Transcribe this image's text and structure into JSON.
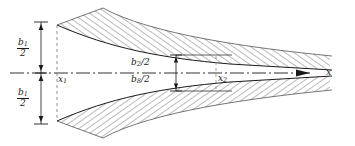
{
  "figure": {
    "background_color": "#ffffff",
    "line_color": "#1a1a1a",
    "hatch_color": "#555555",
    "width": 355,
    "height": 146
  },
  "labels": {
    "half_width_top": {
      "numerator": "b",
      "numerator_sub": "1",
      "denominator": "2",
      "text": "b1/2"
    },
    "half_width_bottom": {
      "numerator": "b",
      "numerator_sub": "1",
      "denominator": "2",
      "text": "b1/2"
    },
    "throat_top": {
      "base": "b",
      "sub": "2",
      "slash_den": "/2",
      "text": "b2/2"
    },
    "throat_bottom": {
      "base": "b",
      "sub": "8",
      "slash_den": "/2",
      "text": "b8/2"
    },
    "station_1": {
      "base": "x",
      "sub": "1",
      "text": "x1"
    },
    "station_2": {
      "base": "x",
      "sub": "2",
      "text": "x2"
    },
    "axis": {
      "base": "x",
      "text": "x"
    }
  },
  "elements": {
    "axis_name": "centerline-axis",
    "arrow_name": "x-axis-arrow",
    "upper_wall_name": "upper-wall-hatched",
    "lower_wall_name": "lower-wall-hatched",
    "left_dimension_name": "left-half-width-dimension",
    "throat_dimension_name": "throat-half-width-dimension",
    "station1_line_name": "station-1-dashed-line",
    "station2_line_name": "station-2-dashed-line"
  }
}
